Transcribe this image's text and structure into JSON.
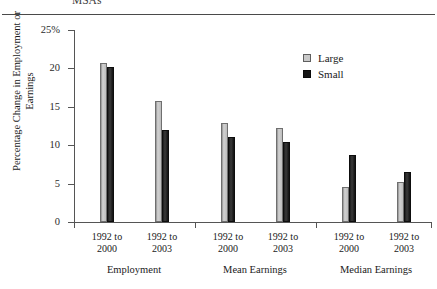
{
  "figure": {
    "title": "MSAs"
  },
  "legend": {
    "position": "top-right",
    "items": [
      {
        "label": "Large",
        "color": "#c9c9c9",
        "swatch": "large-swatch-icon"
      },
      {
        "label": "Small",
        "color": "#151515",
        "swatch": "small-swatch-icon"
      }
    ]
  },
  "axes": {
    "y_title": "Percentage Change in Employment or Earnings",
    "y_ticks": [
      "0",
      "5",
      "10",
      "15",
      "20",
      "25%"
    ]
  },
  "chart_data": {
    "type": "bar",
    "title": "MSAs",
    "xlabel": "",
    "ylabel": "Percentage Change in Employment or Earnings",
    "ylim": [
      0,
      25
    ],
    "ytick_values": [
      0,
      5,
      10,
      15,
      20,
      25
    ],
    "ytick_labels": [
      "0",
      "5",
      "10",
      "15",
      "20",
      "25%"
    ],
    "grid": false,
    "legend_position": "top-right",
    "categories": [
      "1992 to 2000",
      "1992 to 2003",
      "1992 to 2000",
      "1992 to 2003",
      "1992 to 2000",
      "1992 to 2003"
    ],
    "groups": [
      {
        "name": "Employment",
        "categories": [
          "1992 to 2000",
          "1992 to 2003"
        ]
      },
      {
        "name": "Mean Earnings",
        "categories": [
          "1992 to 2000",
          "1992 to 2003"
        ]
      },
      {
        "name": "Median Earnings",
        "categories": [
          "1992 to 2000",
          "1992 to 2003"
        ]
      }
    ],
    "series": [
      {
        "name": "Large",
        "color": "#c9c9c9",
        "values": [
          20.7,
          15.7,
          12.9,
          12.3,
          4.6,
          5.2
        ]
      },
      {
        "name": "Small",
        "color": "#151515",
        "values": [
          20.2,
          12.0,
          11.1,
          10.4,
          8.7,
          6.5
        ]
      }
    ]
  }
}
